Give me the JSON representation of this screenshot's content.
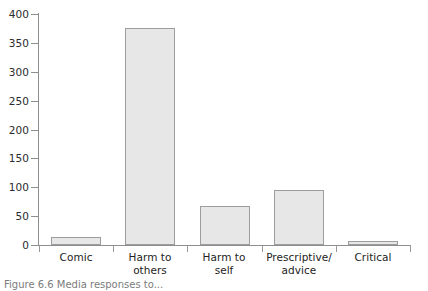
{
  "chart_data": {
    "type": "bar",
    "title": "",
    "xlabel": "",
    "ylabel": "",
    "categories": [
      "Comic",
      "Harm to others",
      "Harm to self",
      "Prescriptive/advice",
      "Critical"
    ],
    "category_lines": [
      [
        "Comic"
      ],
      [
        "Harm to",
        "others"
      ],
      [
        "Harm to",
        "self"
      ],
      [
        "Prescriptive/",
        "advice"
      ],
      [
        "Critical"
      ]
    ],
    "values": [
      13,
      375,
      68,
      96,
      3
    ],
    "ylim": [
      0,
      400
    ],
    "yticks": [
      0,
      50,
      100,
      150,
      200,
      250,
      300,
      350,
      400
    ],
    "ytick_labels": [
      "0",
      "50",
      "100",
      "150",
      "200",
      "250",
      "300",
      "350",
      "400"
    ],
    "grid": false,
    "legend": null,
    "bar_fill_color": "#e7e7e7",
    "bar_border_color": "#9d9d9d",
    "axis_color": "#8e8e8e"
  },
  "caption": {
    "text": "Figure 6.6  Media responses to..."
  }
}
